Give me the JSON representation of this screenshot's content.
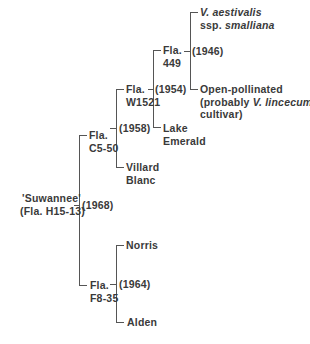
{
  "diagram": {
    "type": "pedigree",
    "root": {
      "name_line1": "'Suwannee'",
      "name_line2": "(Fla. H15-13)",
      "year": "(1968)"
    },
    "nodes": {
      "c550": {
        "line1": "Fla.",
        "line2": "C5-50",
        "year": "(1958)"
      },
      "w1521": {
        "line1": "Fla.",
        "line2": "W1521",
        "year": "(1954)"
      },
      "f449": {
        "line1": "Fla.",
        "line2": "449",
        "year": "(1946)"
      },
      "aestivalis": {
        "line1": "V. aestivalis",
        "line2_prefix": "ssp. ",
        "line2_italic": "smalliana"
      },
      "open_pollinated": {
        "line1": "Open-pollinated",
        "line2_prefix": "(probably ",
        "line2_italic": "V. lincecumi",
        "line3": "cultivar)"
      },
      "lake_emerald": {
        "line1": "Lake",
        "line2": "Emerald"
      },
      "villard_blanc": {
        "line1": "Villard",
        "line2": "Blanc"
      },
      "f835": {
        "line1": "Fla.",
        "line2": "F8-35",
        "year": "(1964)"
      },
      "norris": {
        "line1": "Norris"
      },
      "alden": {
        "line1": "Alden"
      }
    }
  }
}
